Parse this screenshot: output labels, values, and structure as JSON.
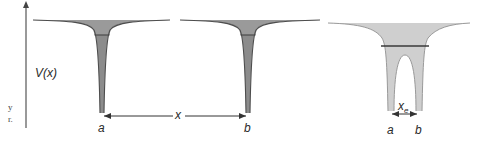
{
  "caption_fragments": [
    "y",
    "r."
  ],
  "axis": {
    "y_label": "V(x)"
  },
  "panels": [
    {
      "id": "isolated-well-a",
      "well_label": "a",
      "fill_color": "#8c8c8c",
      "level_line_color": "#4a4a4a"
    },
    {
      "id": "isolated-well-b",
      "well_label": "b",
      "fill_color": "#8c8c8c",
      "level_line_color": "#4a4a4a"
    },
    {
      "id": "double-well-ab",
      "well_labels": [
        "a",
        "b"
      ],
      "separation_label": "x",
      "separation_subscript": "e",
      "fill_color": "#cfcfcf",
      "level_line_color": "#3a3a3a"
    }
  ],
  "separation_arrow": {
    "label": "x",
    "from": "a",
    "to": "b"
  },
  "colors": {
    "curve_stroke": "#4d4d4d",
    "axis": "#555555",
    "dark_fill": "#8c8c8c",
    "light_fill": "#cfcfcf",
    "text": "#2a2a2a"
  }
}
